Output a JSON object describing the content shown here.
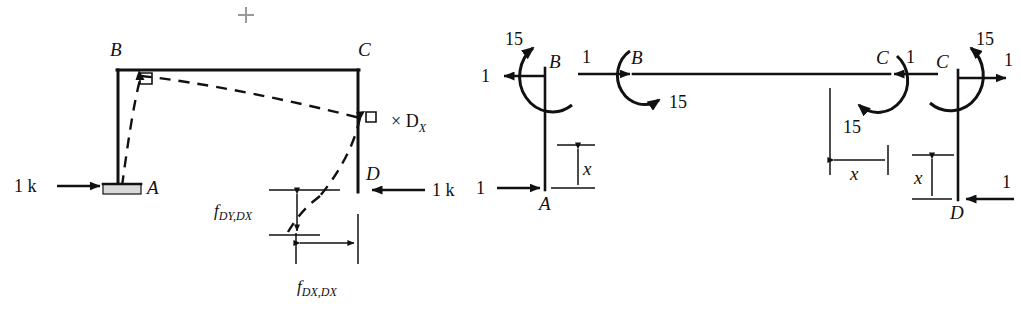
{
  "figure": {
    "plus_mark": "+",
    "left_diagram": {
      "name": "frame-with-unit-load-and-flexibility-coefficients",
      "joint_labels": {
        "A": "A",
        "B": "B",
        "C": "C",
        "D": "D"
      },
      "loads": [
        {
          "id": "load-at-A",
          "label": "1 k",
          "direction": "right"
        },
        {
          "id": "load-at-D",
          "label": "1 k",
          "direction": "left"
        }
      ],
      "multiplier_label": "× D",
      "multiplier_sub": "X",
      "dimensions": [
        {
          "id": "fdydx",
          "base": "f",
          "sub": "DY,DX",
          "orientation": "vertical"
        },
        {
          "id": "fdxdx",
          "base": "f",
          "sub": "DX,DX",
          "orientation": "horizontal"
        }
      ]
    },
    "right_diagram": {
      "name": "free-body-diagrams-of-members",
      "members": [
        {
          "id": "member-AB",
          "top_joint": "B",
          "bottom_joint": "A",
          "moment_label": "15",
          "top_force_label": "1",
          "top_force_direction": "left",
          "bottom_force_label": "1",
          "bottom_force_direction": "right",
          "dimension_label": "x"
        },
        {
          "id": "member-BC",
          "left_joint": "B",
          "right_joint": "C",
          "left_force_label": "1",
          "left_force_direction": "right",
          "left_moment_label": "15",
          "right_force_label": "1",
          "right_force_direction": "left",
          "right_moment_label": "15",
          "dimension_label": "x"
        },
        {
          "id": "member-CD",
          "top_joint": "C",
          "bottom_joint": "D",
          "moment_label": "15",
          "top_force_label": "1",
          "top_force_direction": "right",
          "bottom_force_label": "1",
          "bottom_force_direction": "left",
          "dimension_label": "x"
        }
      ]
    },
    "colors": {
      "ink": "#111111",
      "support_fill": "#d9d9d9",
      "plus_mark": "#9a9a9a"
    }
  }
}
